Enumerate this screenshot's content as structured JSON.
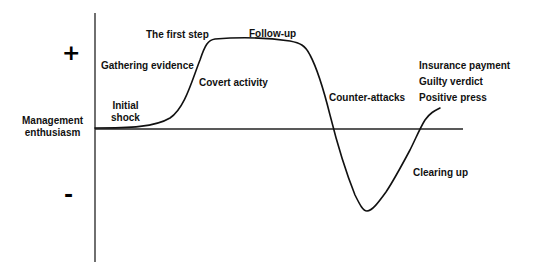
{
  "diagram": {
    "y_axis_label": [
      "Management",
      "enthusiasm"
    ],
    "positive_sign": "+",
    "negative_sign": "-",
    "colors": {
      "line": "#111111",
      "background": "#ffffff"
    },
    "stage_labels": {
      "initial_shock": [
        "Initial",
        "shock"
      ],
      "gathering_evidence": "Gathering evidence",
      "first_step": "The first step",
      "covert_activity": "Covert activity",
      "follow_up": "Follow-up",
      "counter_attacks": "Counter-attacks",
      "clearing_up": "Clearing up",
      "insurance_payment": "Insurance payment",
      "guilty_verdict": "Guilty verdict",
      "positive_press": "Positive press"
    }
  }
}
